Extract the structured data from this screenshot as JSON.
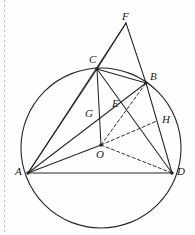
{
  "figure": {
    "name": "circle-geometry-diagram",
    "stroke_color": "#262626",
    "background_color": "#fefefe",
    "canvas": {
      "width": 195,
      "height": 235
    }
  },
  "circle": {
    "label": "circumcircle",
    "center": {
      "x": 101,
      "y": 148
    },
    "radius": 80,
    "stroke_width": 1.1
  },
  "points": [
    {
      "id": "F",
      "label": "F",
      "x": 126,
      "y": 23,
      "label_x": 122,
      "label_y": 11,
      "dot": false,
      "on_circle": false
    },
    {
      "id": "C",
      "label": "C",
      "x": 97,
      "y": 69,
      "label_x": 89,
      "label_y": 54,
      "dot": true,
      "on_circle": true
    },
    {
      "id": "B",
      "label": "B",
      "x": 146,
      "y": 83,
      "label_x": 150,
      "label_y": 71,
      "dot": true,
      "on_circle": true
    },
    {
      "id": "G",
      "label": "G",
      "x": 97,
      "y": 117,
      "label_x": 85,
      "label_y": 108,
      "dot": false,
      "on_circle": false
    },
    {
      "id": "E",
      "label": "E",
      "x": 116,
      "y": 105,
      "label_x": 112,
      "label_y": 98,
      "dot": false,
      "on_circle": false
    },
    {
      "id": "H",
      "label": "H",
      "x": 157,
      "y": 121,
      "label_x": 162,
      "label_y": 114,
      "dot": false,
      "on_circle": false
    },
    {
      "id": "O",
      "label": "O",
      "x": 101,
      "y": 145,
      "label_x": 96,
      "label_y": 149,
      "dot": true,
      "on_circle": false
    },
    {
      "id": "A",
      "label": "A",
      "x": 28,
      "y": 173,
      "label_x": 15,
      "label_y": 166,
      "dot": true,
      "on_circle": true
    },
    {
      "id": "D",
      "label": "D",
      "x": 172,
      "y": 173,
      "label_x": 177,
      "label_y": 166,
      "dot": true,
      "on_circle": true
    }
  ],
  "segments": [
    {
      "from": "A",
      "to": "D",
      "style": "solid",
      "name": "segment-AD"
    },
    {
      "from": "A",
      "to": "C",
      "style": "solid",
      "name": "segment-AC"
    },
    {
      "from": "A",
      "to": "B",
      "style": "solid",
      "name": "segment-AB"
    },
    {
      "from": "A",
      "to": "F",
      "style": "solid",
      "name": "segment-AF"
    },
    {
      "from": "A",
      "to": "O",
      "style": "solid",
      "name": "segment-AO"
    },
    {
      "from": "C",
      "to": "D",
      "style": "solid",
      "name": "segment-CD"
    },
    {
      "from": "C",
      "to": "O",
      "style": "solid",
      "name": "segment-CO"
    },
    {
      "from": "C",
      "to": "F",
      "style": "solid",
      "name": "segment-CF"
    },
    {
      "from": "B",
      "to": "F",
      "style": "solid",
      "name": "segment-BF"
    },
    {
      "from": "B",
      "to": "D",
      "style": "solid",
      "name": "segment-BD"
    },
    {
      "from": "C",
      "to": "B",
      "style": "solid",
      "name": "segment-CB"
    },
    {
      "from": "O",
      "to": "B",
      "style": "dashed",
      "name": "segment-OB"
    },
    {
      "from": "O",
      "to": "H",
      "style": "dashed",
      "name": "segment-OH"
    },
    {
      "from": "O",
      "to": "D",
      "style": "dashed",
      "name": "segment-OD"
    }
  ],
  "annotations": {
    "margin_guide": "page-margin-dotted-rule"
  }
}
